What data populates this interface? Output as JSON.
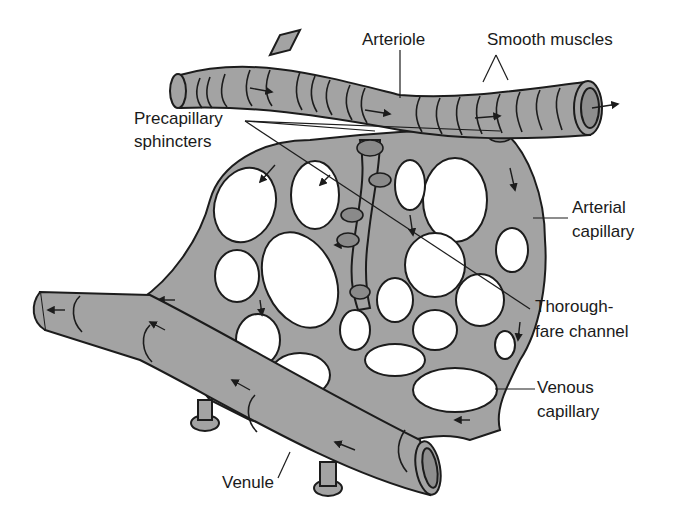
{
  "diagram": {
    "labels": {
      "arteriole": "Arteriole",
      "smooth_muscles": "Smooth muscles",
      "precapillary_line1": "Precapillary",
      "precapillary_line2": "sphincters",
      "arterial_cap_line1": "Arterial",
      "arterial_cap_line2": "capillary",
      "thoroughfare_line1": "Thorough-",
      "thoroughfare_line2": "fare channel",
      "venous_cap_line1": "Venous",
      "venous_cap_line2": "capillary",
      "venule": "Venule"
    },
    "colors": {
      "vessel_fill": "#a3a3a3",
      "outline": "#1c1c1c",
      "background": "#ffffff"
    }
  }
}
